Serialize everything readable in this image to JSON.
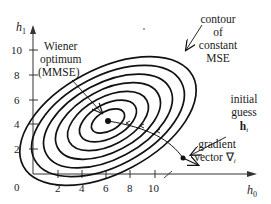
{
  "diagram": {
    "axes": {
      "x_label": "h",
      "x_label_sub": "0",
      "y_label": "h",
      "y_label_sub": "1",
      "x_ticks": [
        "2",
        "4",
        "6",
        "8",
        "10"
      ],
      "y_ticks": [
        "10",
        "8",
        "6",
        "4",
        "2"
      ],
      "origin_label": "0"
    },
    "annotations": {
      "wiener_line1": "Wiener",
      "wiener_line2": "optimum",
      "wiener_line3": "(MMSE)",
      "contour_line1": "contour",
      "contour_line2": "of",
      "contour_line3": "constant",
      "contour_line4": "MSE",
      "initial_line1": "initial",
      "initial_line2": "guess",
      "initial_line3": "h",
      "initial_sub": "i",
      "gradient_line1": "gradient",
      "gradient_line2": "vector ∇",
      "gradient_sub": "i"
    },
    "contours": {
      "count": 7,
      "center": {
        "h0": 6.2,
        "h1": 4.3
      },
      "stroke_color": "#111111"
    },
    "points": {
      "optimum": {
        "h0": 6.2,
        "h1": 4.3,
        "label": "Wiener optimum (MMSE)"
      },
      "initial_guess": {
        "h0": 12.3,
        "h1": 1.1,
        "label": "initial guess h_i"
      }
    }
  }
}
